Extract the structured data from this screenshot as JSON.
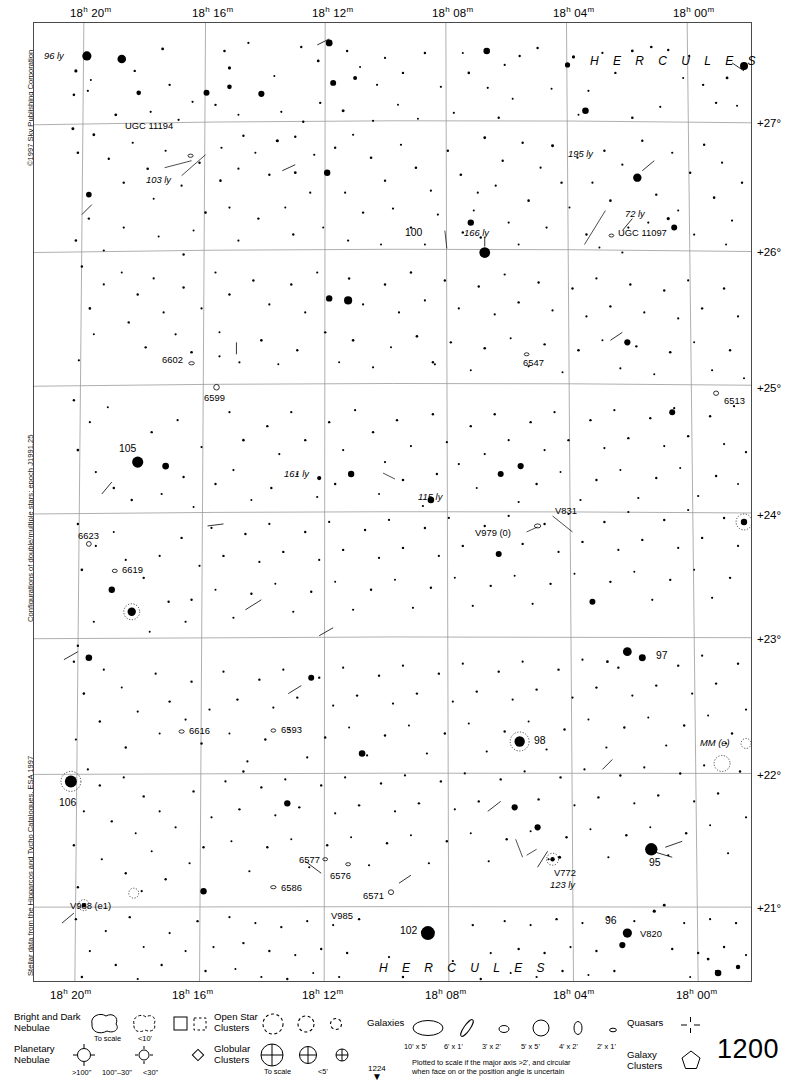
{
  "meta": {
    "copyright": "©1997 Sky Publishing Corporation",
    "note_double_stars": "Configurations of double/multiple stars: epoch J1991.25",
    "note_stellar_data": "Stellar data from the Hipparcos and Tycho Catalogues, ESA 1997",
    "page_number": "1200",
    "next_page_number": "1224",
    "next_page_arrow": "▼",
    "top_cut_marker": "121"
  },
  "chart_data": {
    "type": "scatter",
    "xlabel": "Right Ascension",
    "ylabel": "Declination",
    "ra_ticks_top": [
      "18h 20m",
      "18h 16m",
      "18h 12m",
      "18h 08m",
      "18h 04m",
      "18h 00m"
    ],
    "ra_ticks_bottom": [
      "18h 20m",
      "18h 16m",
      "18h 12m",
      "18h 08m",
      "18h 04m",
      "18h 00m"
    ],
    "dec_ticks": [
      "+27°",
      "+26°",
      "+25°",
      "+24°",
      "+23°",
      "+22°",
      "+21°"
    ],
    "grid": true,
    "constellation_labels": [
      "H E R C U L E S",
      "H E R C U L E S"
    ],
    "magnitude_scale": "dot radius proportional to brightness",
    "objects": [
      {
        "label": "96 ly",
        "type": "distance",
        "italic": true
      },
      {
        "label": "UGC 11194",
        "type": "galaxy"
      },
      {
        "label": "103 ly",
        "type": "distance",
        "italic": true
      },
      {
        "label": "195 ly",
        "type": "distance",
        "italic": true
      },
      {
        "label": "72 ly",
        "type": "distance",
        "italic": true
      },
      {
        "label": "UGC 11097",
        "type": "galaxy"
      },
      {
        "label": "100",
        "type": "flamsteed"
      },
      {
        "label": "166 ly",
        "type": "distance",
        "italic": true
      },
      {
        "label": "6602",
        "type": "ngc"
      },
      {
        "label": "6599",
        "type": "ngc"
      },
      {
        "label": "6547",
        "type": "ngc"
      },
      {
        "label": "6513",
        "type": "ngc"
      },
      {
        "label": "105",
        "type": "flamsteed"
      },
      {
        "label": "161 ly",
        "type": "distance",
        "italic": true
      },
      {
        "label": "115 ly",
        "type": "distance",
        "italic": true
      },
      {
        "label": "V831",
        "type": "variable"
      },
      {
        "label": "V979 (0)",
        "type": "variable"
      },
      {
        "label": "6623",
        "type": "ngc"
      },
      {
        "label": "6619",
        "type": "ngc"
      },
      {
        "label": "97",
        "type": "flamsteed"
      },
      {
        "label": "6616",
        "type": "ngc"
      },
      {
        "label": "6593",
        "type": "ngc"
      },
      {
        "label": "98",
        "type": "flamsteed"
      },
      {
        "label": "MM (e)",
        "type": "variable"
      },
      {
        "label": "106",
        "type": "flamsteed"
      },
      {
        "label": "6577",
        "type": "ngc"
      },
      {
        "label": "6576",
        "type": "ngc"
      },
      {
        "label": "6571",
        "type": "ngc"
      },
      {
        "label": "V772",
        "type": "variable"
      },
      {
        "label": "123 ly",
        "type": "distance",
        "italic": true
      },
      {
        "label": "95",
        "type": "flamsteed"
      },
      {
        "label": "V988 (e1)",
        "type": "variable"
      },
      {
        "label": "6586",
        "type": "ngc"
      },
      {
        "label": "V985",
        "type": "variable"
      },
      {
        "label": "102",
        "type": "flamsteed"
      },
      {
        "label": "96",
        "type": "flamsteed"
      },
      {
        "label": "V820",
        "type": "variable"
      }
    ]
  },
  "legend": {
    "bright_dark_nebulae": {
      "title": "Bright and Dark\nNebulae",
      "to_scale": "To scale",
      "small": "<10'"
    },
    "planetary_nebulae": {
      "title": "Planetary\nNebulae",
      "large": ">100\"",
      "medium": "100\"–30\"",
      "small": "<30\""
    },
    "open_star_clusters": {
      "title": "Open Star\nClusters"
    },
    "globular_clusters": {
      "title": "Globular\nClusters",
      "to_scale": "To scale",
      "small": "<5'"
    },
    "galaxies": {
      "title": "Galaxies",
      "sizes": [
        "10' x 5'",
        "6' x 1'",
        "3' x 2'",
        "5' x 5'",
        "4' x 2'",
        "2' x 1'"
      ],
      "note": "Plotted to scale if the major axis >2', and circular\nwhen face on or the position angle is uncertain"
    },
    "quasars": {
      "title": "Quasars"
    },
    "galaxy_clusters": {
      "title": "Galaxy\nClusters"
    }
  }
}
